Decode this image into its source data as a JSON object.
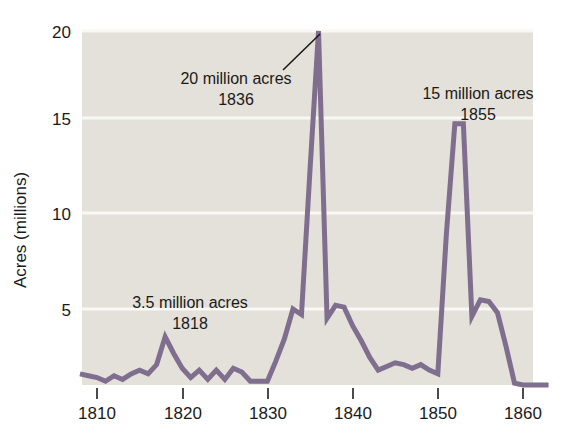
{
  "chart_data": {
    "type": "line",
    "title": "",
    "xlabel": "",
    "ylabel": "Acres (millions)",
    "xlim": [
      1808,
      1863
    ],
    "ylim": [
      0,
      20
    ],
    "xticks": [
      1810,
      1820,
      1830,
      1840,
      1850,
      1860
    ],
    "xtick_labels": [
      "1810",
      "1820",
      "1830",
      "1840",
      "1850",
      "1860"
    ],
    "yticks": [
      5,
      10,
      15,
      20
    ],
    "ytick_labels": [
      "5",
      "10",
      "15",
      "20"
    ],
    "grid": "horizontal",
    "legend": "none",
    "series": [
      {
        "name": "Public land sales",
        "color": "#7f6e8d",
        "x": [
          1808,
          1809,
          1810,
          1811,
          1812,
          1813,
          1814,
          1815,
          1816,
          1817,
          1818,
          1819,
          1820,
          1821,
          1822,
          1823,
          1824,
          1825,
          1826,
          1827,
          1828,
          1829,
          1830,
          1831,
          1832,
          1833,
          1834,
          1835,
          1836,
          1837,
          1838,
          1839,
          1840,
          1841,
          1842,
          1843,
          1844,
          1845,
          1846,
          1847,
          1848,
          1849,
          1850,
          1851,
          1852,
          1853,
          1854,
          1855,
          1856,
          1857,
          1858,
          1859,
          1860,
          1861,
          1862,
          1863
        ],
        "values": [
          1.5,
          1.4,
          1.3,
          1.1,
          1.4,
          1.2,
          1.5,
          1.7,
          1.5,
          2.0,
          3.5,
          2.6,
          1.8,
          1.3,
          1.7,
          1.2,
          1.7,
          1.2,
          1.8,
          1.6,
          1.1,
          1.1,
          1.1,
          2.2,
          3.4,
          5.0,
          4.7,
          12.5,
          20.0,
          4.5,
          5.2,
          5.1,
          4.1,
          3.3,
          2.4,
          1.7,
          1.9,
          2.1,
          2.0,
          1.8,
          2.0,
          1.7,
          1.5,
          9.0,
          15.0,
          15.0,
          4.6,
          5.5,
          5.4,
          4.8,
          3.0,
          1.0,
          0.9,
          0.9,
          0.9,
          0.9
        ]
      }
    ],
    "annotations": [
      {
        "name": "peak-1836",
        "line1": "20 million acres",
        "line2": "1836",
        "x_px": 236,
        "y_px": 78,
        "leader": true
      },
      {
        "name": "peak-1855",
        "line1": "15 million acres",
        "line2": "1855",
        "x_px": 478,
        "y_px": 93,
        "leader": false
      },
      {
        "name": "peak-1818",
        "line1": "3.5 million acres",
        "line2": "1818",
        "x_px": 190,
        "y_px": 302,
        "leader": false
      }
    ],
    "colors": {
      "plot_background": "#e3e1d9",
      "page_background": "#ffffff",
      "line": "#7f6e8d",
      "gridline": "#f7f6f2",
      "text": "#1a1a1a",
      "tick": "#4a4a4a"
    }
  }
}
